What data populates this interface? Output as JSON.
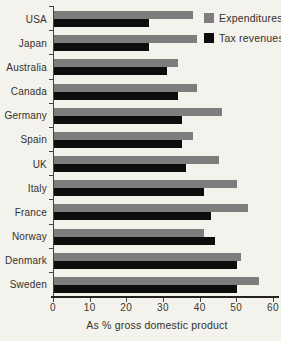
{
  "chart_data": {
    "type": "bar",
    "orientation": "horizontal",
    "title": "",
    "xlabel": "As % gross domestic product",
    "ylabel": "",
    "xlim": [
      0,
      60
    ],
    "xticks": [
      0,
      10,
      20,
      30,
      40,
      50,
      60
    ],
    "grid": false,
    "legend_position": "top-right",
    "categories": [
      "USA",
      "Japan",
      "Australia",
      "Canada",
      "Germany",
      "Spain",
      "UK",
      "Italy",
      "France",
      "Norway",
      "Denmark",
      "Sweden"
    ],
    "series": [
      {
        "name": "Expenditures",
        "color": "#7d7d7d",
        "values": [
          38,
          39,
          34,
          39,
          46,
          38,
          45,
          50,
          53,
          41,
          51,
          56
        ]
      },
      {
        "name": "Tax revenues",
        "color": "#0d0d0d",
        "values": [
          26,
          26,
          31,
          34,
          35,
          35,
          36,
          41,
          43,
          44,
          50,
          50
        ]
      }
    ]
  },
  "colors": {
    "background": "#f3f2ed",
    "axis": "#45433c",
    "text": "#33312b"
  }
}
